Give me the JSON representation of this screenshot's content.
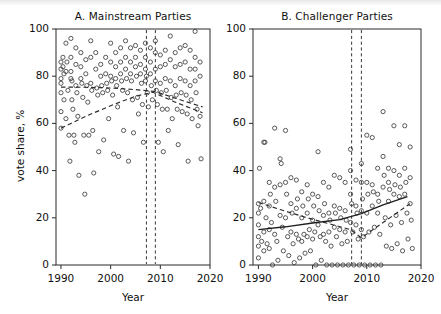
{
  "figure": {
    "width": 441,
    "height": 314,
    "background": "#ffffff",
    "accent": "#3c3c3c"
  },
  "shared": {
    "ylabel": "vote share, %",
    "xlabel": "Year",
    "ytick_labels": [
      "0",
      "20",
      "40",
      "60",
      "80",
      "100"
    ],
    "xtick_labels": [
      "1990",
      "2000",
      "2010",
      "2020"
    ]
  },
  "chart_data": [
    {
      "type": "scatter",
      "panel": "A",
      "title": "A. Mainstream Parties",
      "xlabel": "Year",
      "ylabel": "vote share, %",
      "xlim": [
        1989,
        2020
      ],
      "ylim": [
        0,
        100
      ],
      "xticks": [
        1990,
        2000,
        2010,
        2020
      ],
      "yticks": [
        0,
        20,
        40,
        60,
        80,
        100
      ],
      "grid": false,
      "legend": "none",
      "marker": "open-circle",
      "annotations": {
        "vertical_dashed_lines": [
          2007.2,
          2009.0
        ]
      },
      "series": [
        {
          "name": "mainstream party vote share",
          "style": "scatter",
          "x": [
            1990,
            1990,
            1990,
            1990,
            1990,
            1990,
            1990,
            1990.4,
            1990.4,
            1990.6,
            1990.6,
            1991,
            1991,
            1991,
            1991.2,
            1991.4,
            1991.6,
            1991.8,
            1992,
            1992,
            1992,
            1992,
            1992.2,
            1992.2,
            1992.4,
            1992.6,
            1992.8,
            1993,
            1993,
            1993,
            1993.2,
            1993.4,
            1993.6,
            1994,
            1994,
            1994,
            1994.2,
            1994.4,
            1994.6,
            1994.8,
            1995,
            1995,
            1995.2,
            1995.4,
            1995.6,
            1996,
            1996,
            1996,
            1996.2,
            1996.4,
            1996.6,
            1997,
            1997,
            1997.2,
            1997.4,
            1997.6,
            1998,
            1998,
            1998.2,
            1998.4,
            1998.6,
            1999,
            1999,
            1999.2,
            1999.4,
            1999.6,
            2000,
            2000,
            2000,
            2000.2,
            2000.4,
            2000.6,
            2001,
            2001,
            2001,
            2001.2,
            2001.4,
            2001.6,
            2002,
            2002,
            2002,
            2002.2,
            2002.4,
            2002.6,
            2003,
            2003,
            2003,
            2003.2,
            2003.4,
            2003.6,
            2004,
            2004,
            2004,
            2004.2,
            2004.4,
            2004.6,
            2005,
            2005,
            2005,
            2005.2,
            2005.4,
            2005.6,
            2006,
            2006,
            2006,
            2006.2,
            2006.4,
            2006.6,
            2007,
            2007,
            2007,
            2007,
            2007.2,
            2007.4,
            2007.6,
            2008,
            2008,
            2008,
            2008.2,
            2008.4,
            2009,
            2009,
            2009,
            2009,
            2009.2,
            2009.4,
            2009.6,
            2010,
            2010,
            2010,
            2010.2,
            2010.4,
            2010.6,
            2011,
            2011,
            2011,
            2011.2,
            2011.4,
            2011.6,
            2012,
            2012,
            2012,
            2012.2,
            2012.4,
            2013,
            2013,
            2013,
            2013.2,
            2013.4,
            2013.6,
            2014,
            2014,
            2014,
            2014.2,
            2014.4,
            2015,
            2015,
            2015,
            2015.2,
            2015.4,
            2015.6,
            2016,
            2016,
            2016,
            2016.2,
            2016.4,
            2017,
            2017,
            2017,
            2017,
            2017.2,
            2017.4,
            2017.6,
            2018,
            2018,
            2018,
            2018.2
          ],
          "y": [
            86,
            83,
            79,
            77,
            73,
            65,
            58,
            88,
            84,
            81,
            70,
            94,
            82,
            62,
            86,
            74,
            55,
            44,
            96,
            88,
            82,
            79,
            78,
            70,
            66,
            55,
            52,
            92,
            85,
            76,
            73,
            63,
            38,
            90,
            84,
            79,
            77,
            71,
            55,
            30,
            87,
            81,
            76,
            69,
            55,
            95,
            88,
            77,
            74,
            57,
            39,
            90,
            83,
            75,
            72,
            48,
            85,
            80,
            76,
            73,
            53,
            88,
            81,
            77,
            74,
            62,
            94,
            86,
            80,
            78,
            72,
            47,
            90,
            84,
            79,
            76,
            67,
            46,
            92,
            86,
            81,
            78,
            74,
            57,
            95,
            88,
            83,
            79,
            73,
            44,
            92,
            86,
            81,
            78,
            70,
            56,
            93,
            88,
            84,
            80,
            71,
            64,
            91,
            85,
            81,
            77,
            68,
            52,
            94,
            88,
            83,
            78,
            80,
            73,
            67,
            92,
            86,
            81,
            76,
            70,
            95,
            90,
            83,
            78,
            74,
            68,
            52,
            89,
            84,
            77,
            73,
            66,
            48,
            91,
            85,
            79,
            74,
            66,
            57,
            97,
            87,
            78,
            71,
            62,
            90,
            84,
            76,
            72,
            66,
            51,
            92,
            85,
            79,
            73,
            65,
            93,
            86,
            78,
            72,
            64,
            44,
            91,
            83,
            76,
            70,
            62,
            99,
            88,
            83,
            78,
            73,
            66,
            59,
            86,
            80,
            63,
            45
          ]
        },
        {
          "name": "trend line 1 (dashed, upper)",
          "style": "dashed-line",
          "x": [
            1990,
            1995,
            2000,
            2005,
            2009,
            2014,
            2018.5
          ],
          "y": [
            75.4,
            75.3,
            75.0,
            74.3,
            73.5,
            70.0,
            67.0
          ]
        },
        {
          "name": "trend line 2 (dashed, lower rising)",
          "style": "dashed-line",
          "x": [
            1990,
            1995,
            2000,
            2005,
            2008.5,
            2013,
            2018.5
          ],
          "y": [
            58.0,
            63.0,
            67.5,
            71.5,
            73.2,
            69.0,
            64.5
          ]
        }
      ]
    },
    {
      "type": "scatter",
      "panel": "B",
      "title": "B. Challenger Parties",
      "xlabel": "Year",
      "ylabel": "vote share, %",
      "xlim": [
        1989,
        2020
      ],
      "ylim": [
        0,
        100
      ],
      "xticks": [
        1990,
        2000,
        2010,
        2020
      ],
      "yticks": [
        0,
        20,
        40,
        60,
        80,
        100
      ],
      "grid": false,
      "legend": "none",
      "marker": "open-circle",
      "annotations": {
        "vertical_dashed_lines": [
          2007.2,
          2009.0
        ]
      },
      "series": [
        {
          "name": "challenger party vote share",
          "style": "scatter",
          "x": [
            1990,
            1990,
            1990,
            1990,
            1990,
            1990,
            1990.2,
            1990.4,
            1990.6,
            1991,
            1991,
            1991,
            1991,
            1991.2,
            1991.4,
            1991.6,
            1992,
            1992,
            1992,
            1992,
            1992.2,
            1992.4,
            1992.6,
            1993,
            1993,
            1993,
            1993.2,
            1993.4,
            1993.6,
            1994,
            1994,
            1994,
            1994.2,
            1994.4,
            1994.6,
            1995,
            1995,
            1995,
            1995.2,
            1995.4,
            1995.6,
            1996,
            1996,
            1996,
            1996.2,
            1996.4,
            1996.6,
            1997,
            1997,
            1997,
            1997.2,
            1997.4,
            1997.6,
            1998,
            1998,
            1998,
            1998.2,
            1998.4,
            1998.6,
            1999,
            1999,
            1999,
            1999.2,
            1999.4,
            1999.6,
            2000,
            2000,
            2000,
            2000.2,
            2000.4,
            2000.6,
            2001,
            2001,
            2001,
            2001.2,
            2001.4,
            2001.6,
            2002,
            2002,
            2002,
            2002.2,
            2002.4,
            2002.6,
            2003,
            2003,
            2003,
            2003.2,
            2003.4,
            2003.6,
            2004,
            2004,
            2004,
            2004.2,
            2004.4,
            2004.6,
            2005,
            2005,
            2005,
            2005.2,
            2005.4,
            2005.6,
            2006,
            2006,
            2006,
            2006.2,
            2006.4,
            2006.6,
            2007,
            2007,
            2007,
            2007,
            2007.2,
            2007.4,
            2007.6,
            2008,
            2008,
            2008,
            2008.2,
            2008.4,
            2008.6,
            2009,
            2009,
            2009,
            2009,
            2009.2,
            2009.4,
            2009.6,
            2010,
            2010,
            2010,
            2010.2,
            2010.4,
            2010.6,
            2011,
            2011,
            2011,
            2011.2,
            2011.4,
            2011.6,
            2012,
            2012,
            2012,
            2012.2,
            2012.4,
            2012.6,
            2013,
            2013,
            2013,
            2013.2,
            2013.4,
            2013.6,
            2014,
            2014,
            2014,
            2014.2,
            2014.4,
            2014.6,
            2015,
            2015,
            2015,
            2015.2,
            2015.4,
            2015.6,
            2016,
            2016,
            2016,
            2016.2,
            2016.4,
            2016.6,
            2017,
            2017,
            2017,
            2017.2,
            2017.4,
            2017.6,
            2018,
            2018,
            2018,
            2018.2,
            2018.4
          ],
          "y": [
            26,
            22,
            17,
            12,
            8,
            3,
            41,
            24,
            10,
            52,
            27,
            14,
            6,
            52,
            20,
            9,
            35,
            25,
            15,
            7,
            30,
            18,
            0,
            58,
            33,
            13,
            27,
            10,
            2,
            45,
            34,
            21,
            43,
            16,
            6,
            57,
            35,
            20,
            30,
            12,
            4,
            37,
            26,
            14,
            22,
            9,
            1,
            36,
            24,
            13,
            28,
            11,
            3,
            31,
            20,
            10,
            25,
            13,
            5,
            34,
            22,
            12,
            28,
            15,
            6,
            30,
            19,
            11,
            25,
            14,
            0,
            48,
            29,
            17,
            23,
            12,
            2,
            35,
            21,
            13,
            26,
            10,
            0,
            33,
            22,
            14,
            19,
            8,
            0,
            38,
            25,
            16,
            22,
            12,
            0,
            37,
            24,
            15,
            20,
            9,
            0,
            35,
            23,
            14,
            19,
            10,
            0,
            49,
            40,
            30,
            18,
            26,
            14,
            0,
            36,
            25,
            17,
            22,
            11,
            0,
            43,
            35,
            23,
            15,
            28,
            12,
            0,
            55,
            35,
            22,
            30,
            14,
            0,
            54,
            34,
            25,
            31,
            16,
            0,
            41,
            30,
            22,
            27,
            13,
            0,
            65,
            46,
            33,
            38,
            20,
            8,
            41,
            35,
            27,
            32,
            17,
            7,
            59,
            40,
            30,
            34,
            21,
            9,
            51,
            38,
            29,
            33,
            18,
            6,
            59,
            41,
            30,
            35,
            22,
            11,
            50,
            37,
            26,
            19,
            7
          ]
        },
        {
          "name": "trend line solid (rising)",
          "style": "solid-line",
          "x": [
            1990,
            1995,
            2000,
            2005,
            2009,
            2013,
            2017.5
          ],
          "y": [
            15.0,
            16.2,
            17.8,
            19.2,
            21.8,
            25.5,
            29.0
          ]
        },
        {
          "name": "trend line dashed",
          "style": "dashed-line",
          "x": [
            1990,
            1994,
            1999,
            2003,
            2007,
            2009,
            2013,
            2018
          ],
          "y": [
            26.5,
            23.5,
            20.0,
            17.5,
            15.0,
            11.5,
            18.0,
            26.0
          ]
        }
      ]
    }
  ]
}
